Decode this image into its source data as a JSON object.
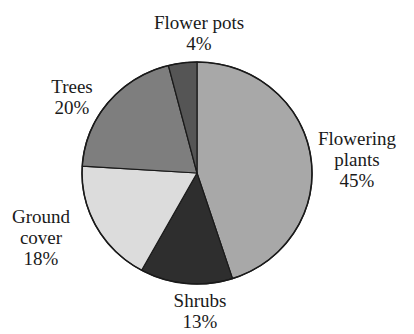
{
  "chart_data": {
    "type": "pie",
    "title": "",
    "start_angle_deg": 0,
    "direction": "clockwise",
    "slices": [
      {
        "label": "Flowering plants",
        "label_lines": [
          "Flowering",
          "plants"
        ],
        "value": 45,
        "value_label": "45%",
        "color": "#a8a8a8"
      },
      {
        "label": "Shrubs",
        "label_lines": [
          "Shrubs"
        ],
        "value": 13,
        "value_label": "13%",
        "color": "#2e2e2e"
      },
      {
        "label": "Ground cover",
        "label_lines": [
          "Ground",
          "cover"
        ],
        "value": 18,
        "value_label": "18%",
        "color": "#dcdcdc"
      },
      {
        "label": "Trees",
        "label_lines": [
          "Trees"
        ],
        "value": 20,
        "value_label": "20%",
        "color": "#7e7e7e"
      },
      {
        "label": "Flower pots",
        "label_lines": [
          "Flower pots"
        ],
        "value": 4,
        "value_label": "4%",
        "color": "#555555"
      }
    ],
    "categories": [
      "Flowering plants",
      "Shrubs",
      "Ground cover",
      "Trees",
      "Flower pots"
    ],
    "values": [
      45,
      13,
      18,
      20,
      4
    ],
    "unit": "%",
    "legend": "none (direct labels)",
    "outline_color": "#1a1a1a"
  },
  "labels": {
    "flowering": {
      "line1": "Flowering",
      "line2": "plants",
      "pct": "45%"
    },
    "shrubs": {
      "line1": "Shrubs",
      "pct": "13%"
    },
    "ground": {
      "line1": "Ground",
      "line2": "cover",
      "pct": "18%"
    },
    "trees": {
      "line1": "Trees",
      "pct": "20%"
    },
    "pots": {
      "line1": "Flower pots",
      "pct": "4%"
    }
  }
}
